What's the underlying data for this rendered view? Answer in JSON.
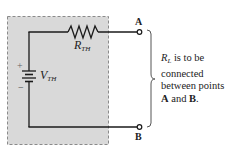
{
  "diagram": {
    "colors": {
      "box_fill": "#d9d9d9",
      "box_border": "#8a8a8a",
      "wire": "#1a1a1a",
      "background": "#ffffff",
      "text": "#222222"
    },
    "components": {
      "resistor": {
        "symbol": "R",
        "subscript": "TH"
      },
      "source": {
        "symbol": "V",
        "subscript": "TH",
        "plus": "+",
        "minus": "−"
      }
    },
    "terminals": {
      "a": {
        "label": "A"
      },
      "b": {
        "label": "B"
      }
    },
    "note": {
      "load_symbol": "R",
      "load_subscript": "L",
      "line1_rest": " is to be",
      "line2": "connected",
      "line3": "between points",
      "line4_a": "A",
      "line4_mid": " and ",
      "line4_b": "B",
      "line4_end": "."
    }
  }
}
